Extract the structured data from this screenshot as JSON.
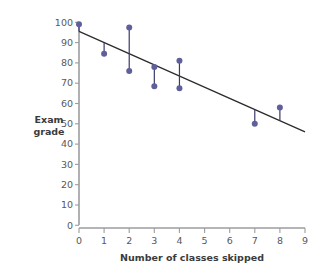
{
  "chart_data": {
    "type": "scatter",
    "title": "",
    "xlabel": "Number of classes skipped",
    "ylabel": "Exam grade",
    "xlim": [
      0,
      9
    ],
    "ylim": [
      0,
      100
    ],
    "xticks": [
      0,
      1,
      2,
      3,
      4,
      5,
      6,
      7,
      8,
      9
    ],
    "yticks": [
      0,
      10,
      20,
      30,
      40,
      50,
      60,
      70,
      80,
      90,
      100
    ],
    "xtick_labels": [
      "0",
      "1",
      "2",
      "3",
      "4",
      "5",
      "6",
      "7",
      "8",
      "9"
    ],
    "ytick_labels": [
      "0",
      "10",
      "20",
      "30",
      "40",
      "50",
      "60",
      "70",
      "80",
      "90",
      "100"
    ],
    "grid": false,
    "legend": false,
    "marker_color": "#5f5f9c",
    "line_color": "#2b2b2b",
    "residual_color": "#3a3a6b",
    "axis_color": "#9d9d9f",
    "points": [
      {
        "x": 0,
        "y": 99.0
      },
      {
        "x": 1,
        "y": 84.5
      },
      {
        "x": 2,
        "y": 97.5
      },
      {
        "x": 2,
        "y": 76.0
      },
      {
        "x": 3,
        "y": 78.0
      },
      {
        "x": 3,
        "y": 68.5
      },
      {
        "x": 4,
        "y": 81.0
      },
      {
        "x": 4,
        "y": 67.5
      },
      {
        "x": 7,
        "y": 50.0
      },
      {
        "x": 8,
        "y": 58.0
      }
    ],
    "regression_line": {
      "x_start": 0,
      "y_start": 95.5,
      "x_end": 9,
      "y_end": 46.0,
      "intercept": 95.5,
      "slope": -5.5
    },
    "residual_segments": [
      {
        "x": 0,
        "y_point": 99.0,
        "y_line": 95.5
      },
      {
        "x": 1,
        "y_point": 84.5,
        "y_line": 90.0
      },
      {
        "x": 2,
        "y_point": 97.5,
        "y_line": 84.5
      },
      {
        "x": 2,
        "y_point": 76.0,
        "y_line": 84.5
      },
      {
        "x": 3,
        "y_point": 78.0,
        "y_line": 79.0
      },
      {
        "x": 3,
        "y_point": 68.5,
        "y_line": 79.0
      },
      {
        "x": 4,
        "y_point": 81.0,
        "y_line": 73.5
      },
      {
        "x": 4,
        "y_point": 67.5,
        "y_line": 73.5
      },
      {
        "x": 7,
        "y_point": 50.0,
        "y_line": 57.0
      },
      {
        "x": 8,
        "y_point": 58.0,
        "y_line": 51.5
      }
    ],
    "ylabel_lines": [
      "Exam",
      "grade"
    ]
  }
}
